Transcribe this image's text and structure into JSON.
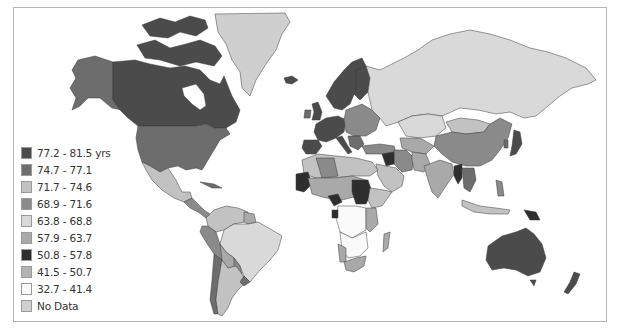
{
  "map": {
    "subject": "Life expectancy by country",
    "frame_color": "#b5b5b5"
  },
  "palette": {
    "c1": "#4b4b4b",
    "c2": "#6d6d6d",
    "c3": "#c2c2c2",
    "c4": "#8a8a8a",
    "c5": "#d9d9d9",
    "c6": "#a9a9a9",
    "c7": "#2e2e2e",
    "c8": "#b3b3b3",
    "c9": "#fafafa",
    "nodata": "#cfcfcf"
  },
  "legend": {
    "items": [
      {
        "label": "77.2 - 81.5 yrs",
        "color": "#4b4b4b"
      },
      {
        "label": "74.7 - 77.1",
        "color": "#6d6d6d"
      },
      {
        "label": "71.7 - 74.6",
        "color": "#c2c2c2"
      },
      {
        "label": "68.9 - 71.6",
        "color": "#8a8a8a"
      },
      {
        "label": "63.8 - 68.8",
        "color": "#d9d9d9"
      },
      {
        "label": "57.9 - 63.7",
        "color": "#a9a9a9"
      },
      {
        "label": "50.8 - 57.8",
        "color": "#2e2e2e"
      },
      {
        "label": "41.5 - 50.7",
        "color": "#b3b3b3"
      },
      {
        "label": "32.7 - 41.4",
        "color": "#fafafa"
      },
      {
        "label": "No Data",
        "color": "#cfcfcf"
      }
    ]
  }
}
